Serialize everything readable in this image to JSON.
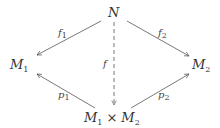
{
  "diagram": {
    "type": "commutative-diagram",
    "colors": {
      "stroke": "#555555",
      "text": "#333333",
      "background": "#ffffff"
    },
    "nodes": {
      "N": {
        "symbol": "N",
        "subscript": ""
      },
      "M1": {
        "symbol": "M",
        "subscript": "1"
      },
      "M2": {
        "symbol": "M",
        "subscript": "2"
      },
      "product": {
        "left": {
          "symbol": "M",
          "subscript": "1"
        },
        "operator": "×",
        "right": {
          "symbol": "M",
          "subscript": "2"
        }
      }
    },
    "arrows": [
      {
        "from": "N",
        "to": "M1",
        "label": {
          "symbol": "f",
          "subscript": "1"
        },
        "style": "solid"
      },
      {
        "from": "N",
        "to": "M2",
        "label": {
          "symbol": "f",
          "subscript": "2"
        },
        "style": "solid"
      },
      {
        "from": "N",
        "to": "product",
        "label": {
          "symbol": "f",
          "subscript": ""
        },
        "style": "dashed"
      },
      {
        "from": "product",
        "to": "M1",
        "label": {
          "symbol": "p",
          "subscript": "1"
        },
        "style": "solid"
      },
      {
        "from": "product",
        "to": "M2",
        "label": {
          "symbol": "p",
          "subscript": "2"
        },
        "style": "solid"
      }
    ]
  }
}
